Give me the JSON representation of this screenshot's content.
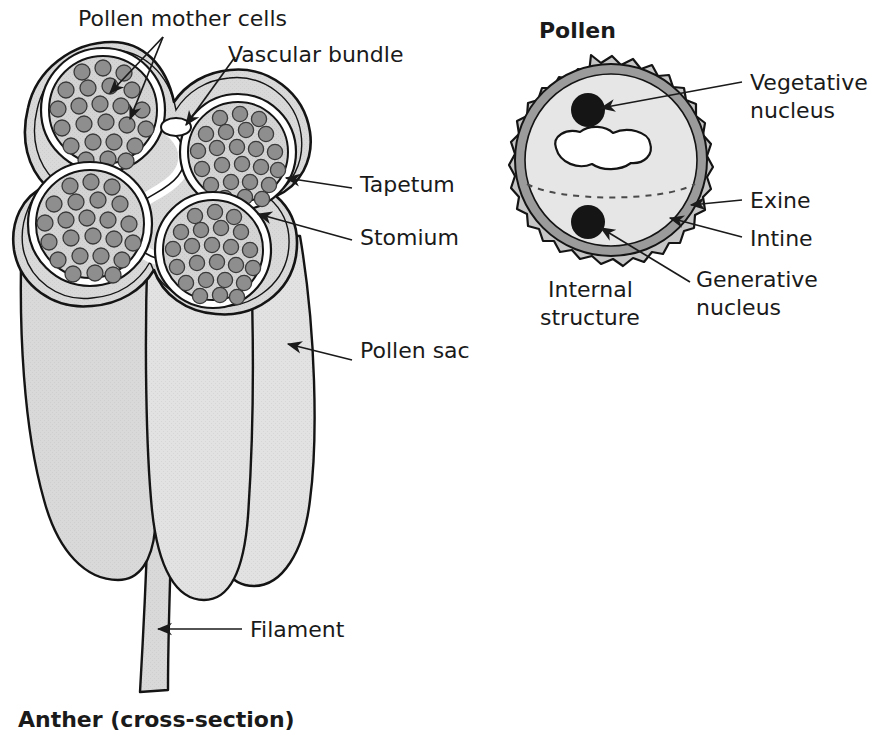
{
  "figure": {
    "caption_left": "Anther (cross-section)",
    "title_right": "Pollen",
    "subtitle_right_line1": "Internal",
    "subtitle_right_line2": "structure"
  },
  "anther": {
    "labels": [
      {
        "id": "pollen-mother-cells",
        "text": "Pollen mother cells"
      },
      {
        "id": "vascular-bundle",
        "text": "Vascular bundle"
      },
      {
        "id": "tapetum",
        "text": "Tapetum"
      },
      {
        "id": "stomium",
        "text": "Stomium"
      },
      {
        "id": "pollen-sac",
        "text": "Pollen sac"
      },
      {
        "id": "filament",
        "text": "Filament"
      }
    ],
    "structure": {
      "lobe_count": 4,
      "loculi": [
        "upper-left",
        "lower-left",
        "upper-right",
        "lower-right"
      ],
      "vascular_bundle_shape": "small white oval at centre",
      "pollen_mother_cells_per_loculus": "approx 30"
    }
  },
  "pollen": {
    "labels": [
      {
        "id": "vegetative-nucleus",
        "line1": "Vegetative",
        "line2": "nucleus"
      },
      {
        "id": "exine",
        "line1": "Exine",
        "line2": ""
      },
      {
        "id": "intine",
        "line1": "Intine",
        "line2": ""
      },
      {
        "id": "generative-nucleus",
        "line1": "Generative",
        "line2": "nucleus"
      }
    ],
    "structure": {
      "outer_wall": "exine (wavy outer layer)",
      "inner_wall": "intine (smooth inner ring)",
      "nuclei": [
        "vegetative nucleus",
        "generative nucleus"
      ],
      "vacuole": "irregular white blob in cytoplasm",
      "equator_line": "dashed"
    }
  },
  "colors": {
    "ink": "#141414",
    "tissue_fill": "#d9d9d9",
    "tissue_fill_light": "#e0e0e0",
    "loculus_fill": "#d2d2d2",
    "mother_cell_fill": "#8e8e8e",
    "mother_cell_stroke": "#3a3a3a",
    "tapetum_fill": "#ffffff",
    "exine_fill": "#c6c6c6",
    "intine_fill": "#9b9b9b",
    "cytoplasm_fill": "#e6e6e6",
    "nucleus_fill": "#151515",
    "vacuole_fill": "#ffffff",
    "background": "#ffffff"
  }
}
